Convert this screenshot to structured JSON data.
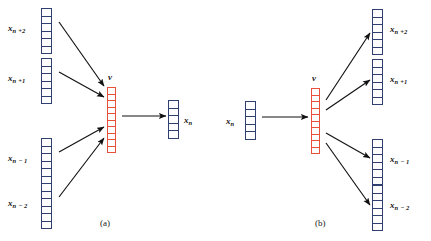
{
  "figure": {
    "background": "#ffffff",
    "vector_color_input": "#2e3f70",
    "vector_color_hidden": "#e8503a",
    "arrow_color": "#111111"
  },
  "panels": [
    {
      "id": "a",
      "caption": "(a)",
      "hidden_label": "v",
      "direction": "many-to-one",
      "inputs": [
        {
          "base": "x",
          "sub": "n +2",
          "cells": 6
        },
        {
          "base": "x",
          "sub": "n +1",
          "cells": 6
        },
        {
          "base": "x",
          "sub": "n − 1",
          "cells": 6
        },
        {
          "base": "x",
          "sub": "n − 2",
          "cells": 6
        }
      ],
      "hidden": {
        "cells": 10
      },
      "outputs": [
        {
          "base": "x",
          "sub": "n",
          "cells": 5
        }
      ]
    },
    {
      "id": "b",
      "caption": "(b)",
      "hidden_label": "v",
      "direction": "one-to-many",
      "inputs": [
        {
          "base": "x",
          "sub": "n",
          "cells": 5
        }
      ],
      "hidden": {
        "cells": 10
      },
      "outputs": [
        {
          "base": "x",
          "sub": "n +2",
          "cells": 6
        },
        {
          "base": "x",
          "sub": "n +1",
          "cells": 6
        },
        {
          "base": "x",
          "sub": "n − 1",
          "cells": 6
        },
        {
          "base": "x",
          "sub": "n − 2",
          "cells": 6
        }
      ]
    }
  ]
}
